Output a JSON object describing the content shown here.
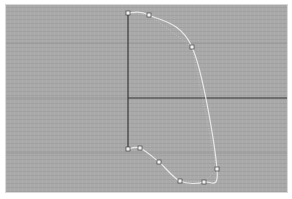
{
  "viewport": {
    "background": "#a9a9a9",
    "grid_color": "#9e9e9e",
    "axis_color": "#3a3a3a",
    "curve_color": "#e8e8e8",
    "hull_color": "#cfcfcf",
    "point_fill": "#f4f4f4",
    "point_stroke": "#444444"
  },
  "axes": {
    "y_axis": {
      "x": 128,
      "y1": 13,
      "y2": 149
    },
    "x_axis": {
      "y": 98,
      "x1": 128,
      "x2": 287
    }
  },
  "grid_lines": {
    "horizontal": [
      43,
      98,
      153
    ],
    "vertical": []
  },
  "curve": {
    "control_points": [
      {
        "x": 128,
        "y": 13
      },
      {
        "x": 149,
        "y": 15
      },
      {
        "x": 192,
        "y": 47
      },
      {
        "x": 217,
        "y": 169
      },
      {
        "x": 204,
        "y": 182
      },
      {
        "x": 180,
        "y": 181
      },
      {
        "x": 159,
        "y": 162
      },
      {
        "x": 140,
        "y": 148
      },
      {
        "x": 128,
        "y": 149
      }
    ]
  }
}
